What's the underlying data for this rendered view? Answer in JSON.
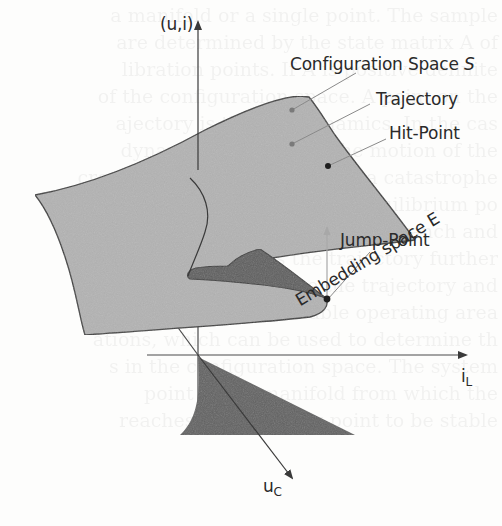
{
  "figure": {
    "labels": {
      "vertical_axis": "(u,i)",
      "horizontal_axis_main": "i",
      "horizontal_axis_sub": "L",
      "diagonal_axis_main": "u",
      "diagonal_axis_sub": "C",
      "configuration_space_text": "Configuration Space ",
      "configuration_space_symbol": "S",
      "trajectory": "Trajectory",
      "hit_point": "Hit-Point",
      "jump_point": "Jump-Point",
      "embedding_space": "Embedding space E"
    },
    "colors": {
      "surface_fill": "#b3b3b3",
      "fold_fill": "#5e5e5e",
      "projection_fill": "#626262",
      "outline": "#3a3a3a",
      "axis": "#4a4a4a",
      "leader_line": "#8a8a8a",
      "jump_arrow": "#a8a8a8",
      "hit_point_dot": "#1e1e1e",
      "trajectory_dot": "#7a7a7a"
    }
  },
  "bleed_through_text": [
    "a manifold or a single point. The sample",
    "are determined by the state matrix A of",
    "libration points. If A is positive definite",
    "of the configuration space. A point on the",
    "ajectory is the fast dynamics. In the cas",
    "dynamics determines the motion of the",
    "cross the fold of the manifold a catastrophe",
    "the state jumps to another equilibrium po",
    "the jump leads to a new stable branch and",
    "ow dynamics guides the trajectory further",
    "nation is to describe the trajectory and",
    "aracteristics for the stable operating area",
    "ations, which can be used to determine th",
    "s in the configuration space. The system",
    "point of the manifold from which the",
    "reaches an operating point to be stable"
  ]
}
